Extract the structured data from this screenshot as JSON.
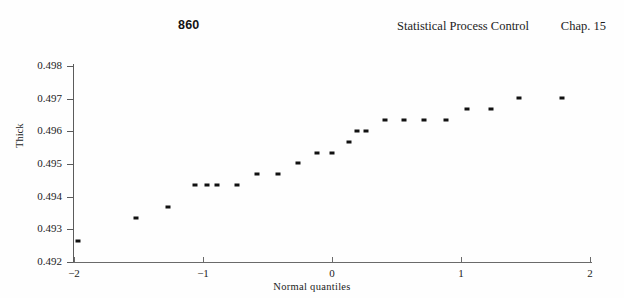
{
  "running_head": {
    "page_number": "860",
    "title": "Statistical Process Control",
    "chapter": "Chap. 15"
  },
  "chart_data": {
    "type": "scatter",
    "title": "",
    "xlabel": "Normal  quantiles",
    "ylabel": "Thick",
    "xlim": [
      -2.0,
      2.0
    ],
    "ylim": [
      0.492,
      0.498
    ],
    "xticks": [
      -2,
      -1,
      0,
      1,
      2
    ],
    "xtick_labels": [
      "−2",
      "−1",
      "0",
      "1",
      "2"
    ],
    "yticks": [
      0.492,
      0.493,
      0.494,
      0.495,
      0.496,
      0.497,
      0.498
    ],
    "ytick_labels": [
      "0.492",
      "0.493",
      "0.494",
      "0.495",
      "0.496",
      "0.497",
      "0.498"
    ],
    "grid": false,
    "legend": "none",
    "marker": "filled-rectangle",
    "marker_color": "#111111",
    "points": [
      {
        "x": -1.97,
        "y": 0.49265
      },
      {
        "x": -1.52,
        "y": 0.49335
      },
      {
        "x": -1.27,
        "y": 0.49368
      },
      {
        "x": -1.06,
        "y": 0.49435
      },
      {
        "x": -0.89,
        "y": 0.49435
      },
      {
        "x": -0.74,
        "y": 0.49435
      },
      {
        "x": -0.58,
        "y": 0.49468
      },
      {
        "x": -0.42,
        "y": 0.49468
      },
      {
        "x": -0.26,
        "y": 0.49502
      },
      {
        "x": -0.12,
        "y": 0.49535
      },
      {
        "x": 0.0,
        "y": 0.49535
      },
      {
        "x": 0.13,
        "y": 0.49568
      },
      {
        "x": 0.26,
        "y": 0.49602
      },
      {
        "x": 0.41,
        "y": 0.49635
      },
      {
        "x": 0.56,
        "y": 0.49635
      },
      {
        "x": 0.71,
        "y": 0.49635
      },
      {
        "x": 0.88,
        "y": 0.49635
      },
      {
        "x": 1.05,
        "y": 0.49668
      },
      {
        "x": 1.23,
        "y": 0.49668
      },
      {
        "x": 1.45,
        "y": 0.49702
      },
      {
        "x": 1.78,
        "y": 0.49702
      },
      {
        "x": 2.33,
        "y": 0.49735
      },
      {
        "x": -0.97,
        "y": 0.49435
      },
      {
        "x": 0.19,
        "y": 0.49602
      }
    ]
  }
}
